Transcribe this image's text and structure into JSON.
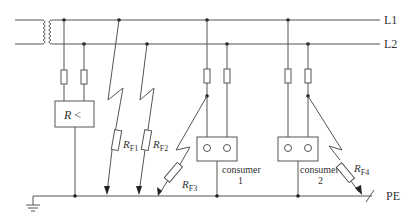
{
  "diagram": {
    "lines": {
      "l1": "L1",
      "l2": "L2",
      "pe": "PE"
    },
    "monitor": {
      "label_r": "R",
      "label_op": "<"
    },
    "faults": [
      {
        "r": "R",
        "sub": "F1"
      },
      {
        "r": "R",
        "sub": "F2"
      },
      {
        "r": "R",
        "sub": "F3"
      },
      {
        "r": "R",
        "sub": "F4"
      }
    ],
    "consumers": [
      {
        "name": "consumer",
        "num": "1"
      },
      {
        "name": "consumer",
        "num": "2"
      }
    ],
    "colors": {
      "line": "#555555",
      "text": "#333333"
    }
  }
}
